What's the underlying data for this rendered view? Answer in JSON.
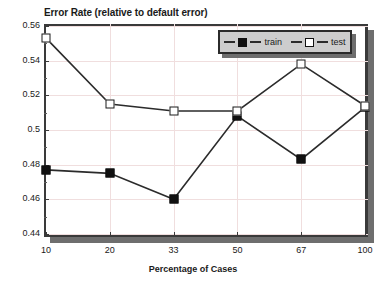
{
  "chart_data": {
    "type": "line",
    "title": "Error Rate (relative to default error)",
    "xlabel": "Percentage of Cases",
    "ylabel": "",
    "categories": [
      "10",
      "20",
      "33",
      "50",
      "67",
      "100"
    ],
    "series": [
      {
        "name": "train",
        "marker": "filled-square",
        "color": "#111111",
        "values": [
          0.477,
          0.475,
          0.46,
          0.508,
          0.483,
          0.513
        ]
      },
      {
        "name": "test",
        "marker": "open-square",
        "color": "#111111",
        "values": [
          0.553,
          0.515,
          0.511,
          0.511,
          0.538,
          0.514
        ]
      }
    ],
    "ylim": [
      0.44,
      0.56
    ],
    "yticks": [
      0.44,
      0.46,
      0.48,
      0.5,
      0.52,
      0.54,
      0.56
    ],
    "ytick_labels": [
      "0.44",
      "0.46",
      "0.48",
      "0.5",
      "0.52",
      "0.54",
      "0.56"
    ],
    "grid": true,
    "legend_position": "top-right"
  },
  "legend": {
    "entries": [
      {
        "label": "train"
      },
      {
        "label": "test"
      }
    ]
  },
  "colors": {
    "line": "#2b2b2b",
    "frame": "#3a3a3a",
    "shadow": "#6e6e6e",
    "grid": "#f0dede",
    "legend_background": "#cdcdcd",
    "text": "#1a1a1a",
    "background": "#ffffff"
  }
}
